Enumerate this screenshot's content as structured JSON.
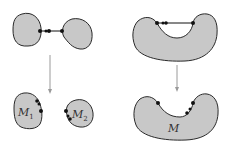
{
  "diagram": {
    "colors": {
      "fill": "#c8c8c8",
      "stroke": "#2a2a2a",
      "dot": "#111111",
      "arrow": "#9a9a9a"
    },
    "left": {
      "top": {
        "caption": "two blobs joined by an arc with marked points"
      },
      "arrow": "down-arrow",
      "bottom": {
        "labels": [
          {
            "base": "M",
            "sub": "1"
          },
          {
            "base": "M",
            "sub": "2"
          }
        ]
      }
    },
    "right": {
      "top": {
        "caption": "U-shaped blob with chord joining two boundary points"
      },
      "arrow": "down-arrow",
      "bottom": {
        "labels": [
          {
            "base": "M",
            "sub": ""
          }
        ]
      }
    }
  }
}
